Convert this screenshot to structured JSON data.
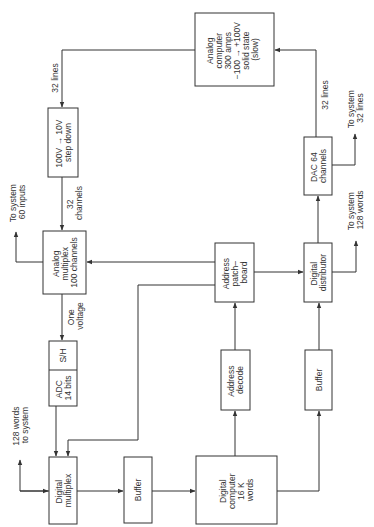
{
  "diagram": {
    "orientation": "rotated-90-ccw",
    "blocks": {
      "analog_computer": [
        "Analog",
        "computer",
        "300 amps",
        "−100 → +100V",
        "solid state",
        "(slow)"
      ],
      "step_down": [
        "100V → 10V",
        "step down"
      ],
      "analog_multiplex": [
        "Analog",
        "multiplex",
        "100 channels"
      ],
      "adc": [
        "ADC",
        "14 bits"
      ],
      "sh": "S/H",
      "digital_multiplex": [
        "Digital",
        "multiplex"
      ],
      "buffer_left": "Buffer",
      "digital_computer": [
        "Digital",
        "computer",
        "16 K",
        "words"
      ],
      "address_decode": [
        "Address",
        "decode"
      ],
      "address_patchboard": [
        "Address",
        "patch–",
        "board"
      ],
      "buffer_right": "Buffer",
      "digital_distributor": [
        "Digital",
        "distributor"
      ],
      "dac": [
        "DAC 64",
        "channels"
      ]
    },
    "labels": {
      "lines_32_top": "32 lines",
      "channels_32": [
        "32",
        "channels"
      ],
      "to_system_60": [
        "To system",
        "60 inputs"
      ],
      "one_voltage": [
        "One",
        "voltage"
      ],
      "words_128_to_system": [
        "128 words",
        "to system"
      ],
      "to_system_128": [
        "To system",
        "128 words"
      ],
      "to_system_32": [
        "To system",
        "32 lines"
      ],
      "lines_32_right": "32 lines"
    }
  }
}
